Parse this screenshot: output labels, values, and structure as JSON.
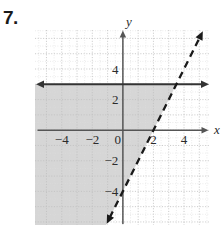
{
  "problem": {
    "number": "7."
  },
  "chart_data": {
    "type": "line",
    "title": "",
    "xlabel": "x",
    "ylabel": "y",
    "xlim": [
      -5.75,
      5.7
    ],
    "ylim": [
      -6.2,
      6.55
    ],
    "grid": true,
    "grid_minor_step": 0.5,
    "grid_major_step": 1,
    "legend": "none",
    "x_ticks": [
      -4,
      -2,
      0,
      2,
      4
    ],
    "x_tick_labels": [
      "−4",
      "−2",
      "0",
      "2",
      "4"
    ],
    "y_ticks": [
      -4,
      -2,
      2,
      4
    ],
    "y_tick_labels": [
      "−4",
      "−2",
      "2",
      "4"
    ],
    "series": [
      {
        "name": "horizontal boundary",
        "kind": "line",
        "style": "solid",
        "equation": "y = 3",
        "slope": 0,
        "intercept": 3,
        "arrows": "both",
        "color": "#333333"
      },
      {
        "name": "slanted boundary",
        "kind": "line",
        "style": "dashed",
        "equation": "y = 2x - 4",
        "slope": 2,
        "intercept": -4,
        "x_intercept": 2,
        "arrows": "both",
        "color": "#1a1a1a"
      }
    ],
    "shaded_region": {
      "description": "region below y = 3 and to the left of y = 2x - 4",
      "conditions": [
        "y < 3",
        "y > 2x - 4"
      ],
      "fill": "#d6d6d6"
    },
    "annotations": []
  },
  "colors": {
    "shading": "#d6d6d6",
    "axis": "#555555",
    "line": "#333333",
    "grid_minor": "#d9d9d9",
    "grid_major": "#c4c4c4",
    "text": "#2b2b2b",
    "background": "#ffffff"
  }
}
